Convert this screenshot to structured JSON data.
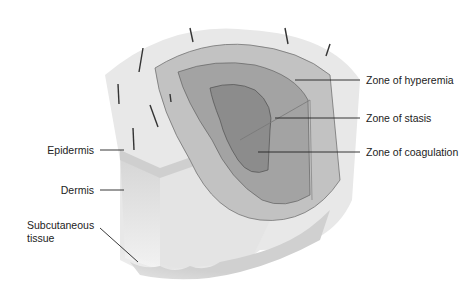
{
  "diagram": {
    "type": "burn wound cross-section illustration",
    "labels_left": [
      {
        "id": "epidermis",
        "text": "Epidermis"
      },
      {
        "id": "dermis",
        "text": "Dermis"
      },
      {
        "id": "subcutaneous",
        "text_line1": "Subcutaneous",
        "text_line2": "tissue"
      }
    ],
    "labels_right": [
      {
        "id": "hyperemia",
        "text": "Zone of hyperemia"
      },
      {
        "id": "stasis",
        "text": "Zone of stasis"
      },
      {
        "id": "coagulation",
        "text": "Zone of coagulation"
      }
    ],
    "colors": {
      "skin_surface": "#e6e6e6",
      "hyperemia": "#bdbdbd",
      "stasis": "#9d9d9d",
      "coagulation": "#8a8a8a",
      "leader_line": "#222222"
    }
  }
}
